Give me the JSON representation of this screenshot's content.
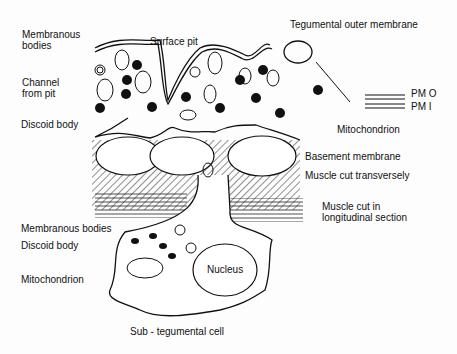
{
  "diagram": {
    "labels": {
      "membranous_bodies_top": "Membranous\nbodies",
      "surface_pit": "Surface pit",
      "tegumental_outer_membrane": "Tegumental outer membrane",
      "channel_from_pit": "Channel\nfrom pit",
      "discoid_body_top": "Discoid body",
      "pmo": "PM O",
      "pmi": "PM I",
      "mitochondrion_top": "Mitochondrion",
      "basement_membrane": "Basement membrane",
      "muscle_transverse": "Muscle cut transversely",
      "muscle_longitudinal": "Muscle cut in\nlongitudinal section",
      "membranous_bodies_bottom": "Membranous bodies",
      "discoid_body_bottom": "Discoid body",
      "mitochondrion_bottom": "Mitochondrion",
      "nucleus": "Nucleus",
      "sub_tegumental_cell": "Sub - tegumental cell"
    }
  }
}
